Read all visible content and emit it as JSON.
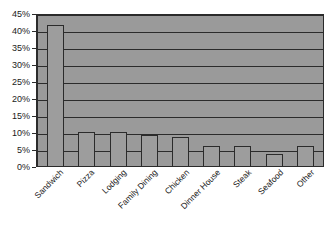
{
  "chart_data": {
    "type": "bar",
    "title": "",
    "subtitle": "",
    "xlabel": "",
    "ylabel": "",
    "categories": [
      "Sandwich",
      "Pizza",
      "Lodging",
      "Family Dining",
      "Chicken",
      "Dinner House",
      "Steak",
      "Seafood",
      "Other"
    ],
    "values": [
      41.5,
      10,
      10,
      9,
      8.5,
      6,
      6,
      3.5,
      6
    ],
    "value_suffix": "%",
    "ylim": [
      0,
      45
    ],
    "ytick_values": [
      0,
      5,
      10,
      15,
      20,
      25,
      30,
      35,
      40,
      45
    ],
    "ytick_labels": [
      "0%",
      "5%",
      "10%",
      "15%",
      "20%",
      "25%",
      "30%",
      "35%",
      "40%",
      "45%"
    ],
    "grid": true,
    "grid_axis": "y",
    "legend": false,
    "legend_position": "none",
    "series": [
      {
        "name": "Share",
        "values": [
          41.5,
          10,
          10,
          9,
          8.5,
          6,
          6,
          3.5,
          6
        ]
      }
    ],
    "colors": {
      "plot_background": "#9a9a9a",
      "bar_fill": "#9d9d9d",
      "bar_outline": "#2b2b2b",
      "gridline": "#2b2b2b",
      "axis": "#2b2b2b",
      "text": "#1a1a1a",
      "figure_background": "#ffffff"
    }
  }
}
